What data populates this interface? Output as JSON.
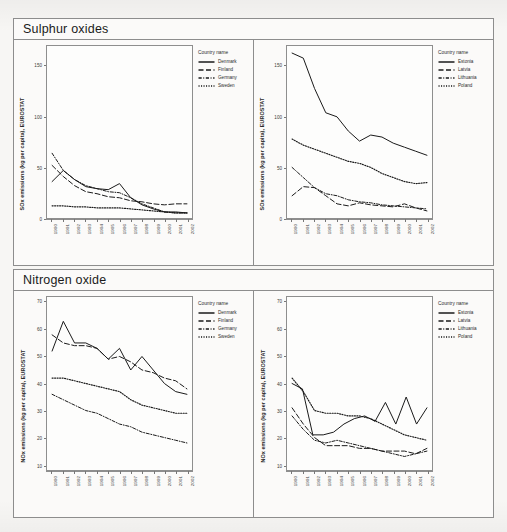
{
  "figure": {
    "panels": [
      {
        "title": "Sulphur oxides",
        "ylabel": "SOx emissions (kg per capita), EUROSTAT"
      },
      {
        "title": "Nitrogen oxide",
        "ylabel": "NOx emissions (kg per capita), EUROSTAT"
      }
    ],
    "legend_title": "Country name"
  },
  "chart_data": [
    {
      "id": "sox-nordic",
      "type": "line",
      "title": "Sulphur oxides",
      "xlabel": "",
      "ylabel": "SOx emissions (kg per capita), EUROSTAT",
      "x": [
        1990,
        1991,
        1992,
        1993,
        1994,
        1995,
        1996,
        1997,
        1998,
        1999,
        2000,
        2001,
        2002
      ],
      "xtick_labels": [
        "1990",
        "1991",
        "1992",
        "1993",
        "1994",
        "1995",
        "1996",
        "1997",
        "1998",
        "1999",
        "2000",
        "2001",
        "2002"
      ],
      "ytick_labels": [
        "0",
        "50",
        "100",
        "150"
      ],
      "yticks": [
        0,
        50,
        100,
        150
      ],
      "ylim": [
        0,
        170
      ],
      "grid": false,
      "legend_position": "right",
      "legend_title": "Country name",
      "series": [
        {
          "name": "Denmark",
          "style": "solid",
          "values": [
            36,
            47,
            38,
            31,
            29,
            28,
            34,
            20,
            13,
            9,
            6,
            6,
            5
          ]
        },
        {
          "name": "Finland",
          "style": "dashed",
          "values": [
            52,
            41,
            32,
            26,
            24,
            21,
            20,
            17,
            16,
            14,
            13,
            14,
            14
          ]
        },
        {
          "name": "Germany",
          "style": "dash-dot",
          "values": [
            64,
            47,
            38,
            32,
            29,
            26,
            25,
            20,
            14,
            10,
            6,
            5,
            5
          ]
        },
        {
          "name": "Sweden",
          "style": "dotted",
          "values": [
            12,
            12,
            11,
            11,
            10,
            10,
            10,
            9,
            8,
            7,
            6,
            5,
            5
          ]
        }
      ]
    },
    {
      "id": "sox-baltic",
      "type": "line",
      "title": "Sulphur oxides",
      "xlabel": "",
      "ylabel": "SOx emissions (kg per capita), EUROSTAT",
      "x": [
        1990,
        1991,
        1992,
        1993,
        1994,
        1995,
        1996,
        1997,
        1998,
        1999,
        2000,
        2001,
        2002
      ],
      "xtick_labels": [
        "1990",
        "1991",
        "1992",
        "1993",
        "1994",
        "1995",
        "1996",
        "1997",
        "1998",
        "1999",
        "2000",
        "2001",
        "2002"
      ],
      "ytick_labels": [
        "0",
        "50",
        "100",
        "150"
      ],
      "yticks": [
        0,
        50,
        100,
        150
      ],
      "ylim": [
        0,
        170
      ],
      "grid": false,
      "legend_position": "right",
      "legend_title": "Country name",
      "series": [
        {
          "name": "Estonia",
          "style": "solid",
          "values": [
            163,
            158,
            128,
            104,
            100,
            86,
            76,
            82,
            80,
            74,
            70,
            66,
            62
          ]
        },
        {
          "name": "Latvia",
          "style": "dashed",
          "values": [
            22,
            31,
            30,
            22,
            14,
            12,
            15,
            13,
            12,
            11,
            14,
            10,
            7
          ]
        },
        {
          "name": "Lithuania",
          "style": "dash-dot",
          "values": [
            50,
            40,
            30,
            24,
            22,
            18,
            16,
            15,
            13,
            12,
            11,
            10,
            9
          ]
        },
        {
          "name": "Poland",
          "style": "dotted",
          "values": [
            78,
            72,
            68,
            64,
            60,
            56,
            54,
            50,
            44,
            40,
            36,
            34,
            35
          ]
        }
      ]
    },
    {
      "id": "nox-nordic",
      "type": "line",
      "title": "Nitrogen oxide",
      "xlabel": "",
      "ylabel": "NOx emissions (kg per capita), EUROSTAT",
      "x": [
        1990,
        1991,
        1992,
        1993,
        1994,
        1995,
        1996,
        1997,
        1998,
        1999,
        2000,
        2001,
        2002
      ],
      "xtick_labels": [
        "1990",
        "1991",
        "1992",
        "1993",
        "1994",
        "1995",
        "1996",
        "1997",
        "1998",
        "1999",
        "2000",
        "2001",
        "2002"
      ],
      "ytick_labels": [
        "10",
        "20",
        "30",
        "40",
        "50",
        "60",
        "70"
      ],
      "yticks": [
        10,
        20,
        30,
        40,
        50,
        60,
        70
      ],
      "ylim": [
        8,
        72
      ],
      "grid": false,
      "legend_position": "right",
      "legend_title": "Country name",
      "series": [
        {
          "name": "Denmark",
          "style": "solid",
          "values": [
            52,
            63,
            55,
            55,
            53,
            49,
            53,
            45,
            50,
            45,
            40,
            37,
            36
          ]
        },
        {
          "name": "Finland",
          "style": "dashed",
          "values": [
            58,
            55,
            54,
            54,
            53,
            49,
            50,
            48,
            45,
            44,
            42,
            41,
            38
          ]
        },
        {
          "name": "Germany",
          "style": "dash-dot",
          "values": [
            36,
            34,
            32,
            30,
            29,
            27,
            25,
            24,
            22,
            21,
            20,
            19,
            18
          ]
        },
        {
          "name": "Sweden",
          "style": "dotted",
          "values": [
            42,
            42,
            41,
            40,
            39,
            38,
            37,
            34,
            32,
            31,
            30,
            29,
            29
          ]
        }
      ]
    },
    {
      "id": "nox-baltic",
      "type": "line",
      "title": "Nitrogen oxide",
      "xlabel": "",
      "ylabel": "NOx emissions (kg per capita), EUROSTAT",
      "x": [
        1990,
        1991,
        1992,
        1993,
        1994,
        1995,
        1996,
        1997,
        1998,
        1999,
        2000,
        2001,
        2002
      ],
      "xtick_labels": [
        "1990",
        "1991",
        "1992",
        "1993",
        "1994",
        "1995",
        "1996",
        "1997",
        "1998",
        "1999",
        "2000",
        "2001",
        "2002"
      ],
      "ytick_labels": [
        "10",
        "20",
        "30",
        "40",
        "50",
        "60",
        "70"
      ],
      "yticks": [
        10,
        20,
        30,
        40,
        50,
        60,
        70
      ],
      "ylim": [
        8,
        72
      ],
      "grid": false,
      "legend_position": "right",
      "legend_title": "Country name",
      "series": [
        {
          "name": "Estonia",
          "style": "solid",
          "values": [
            40,
            38,
            21,
            21,
            22,
            25,
            27,
            28,
            26,
            33,
            25,
            35,
            25,
            31
          ]
        },
        {
          "name": "Latvia",
          "style": "dashed",
          "values": [
            31,
            25,
            20,
            17,
            17,
            17,
            16,
            16,
            15,
            15,
            15,
            14,
            16
          ]
        },
        {
          "name": "Lithuania",
          "style": "dash-dot",
          "values": [
            28,
            23,
            19,
            18,
            19,
            18,
            17,
            16,
            15,
            14,
            13,
            14,
            15
          ]
        },
        {
          "name": "Poland",
          "style": "dotted",
          "values": [
            42,
            37,
            30,
            29,
            29,
            28,
            28,
            27,
            25,
            23,
            21,
            20,
            19
          ]
        }
      ]
    }
  ],
  "colors": {
    "line": "#1a1a1a",
    "frame": "#8d8d8d",
    "paper": "#f7f6f4"
  }
}
